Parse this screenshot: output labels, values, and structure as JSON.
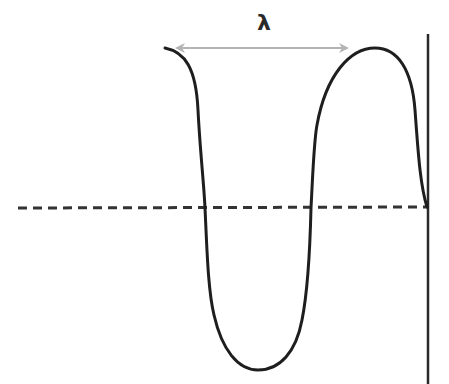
{
  "diagram": {
    "wavelength_label": "λ",
    "colors": {
      "wave": "#1e1e1e",
      "axis_dashed": "#333333",
      "boundary_line": "#2a2a2a",
      "wavelength_arrow": "#b4b4b4",
      "background": "#ffffff"
    },
    "elements": {
      "wave_curve": "sinusoidal-like wave starting at top-left, dipping below axis to a trough, rising to a crest, and ending at the axis on the boundary wall",
      "equilibrium_axis": "horizontal dashed line",
      "boundary_wall": "vertical solid line on the right",
      "wavelength_arrow": "double-headed gray arrow spanning one wavelength between the two crests"
    }
  }
}
